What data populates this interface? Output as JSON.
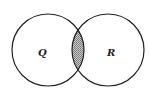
{
  "diagram": {
    "type": "venn",
    "sets": [
      {
        "label": "Q",
        "cx": 48,
        "cy": 50,
        "r": 36
      },
      {
        "label": "R",
        "cx": 108,
        "cy": 50,
        "r": 36
      }
    ],
    "shaded_region": "Q ∩ R",
    "colors": {
      "stroke": "#222222",
      "shade": "#9a9a9a",
      "background": "#ffffff"
    }
  }
}
